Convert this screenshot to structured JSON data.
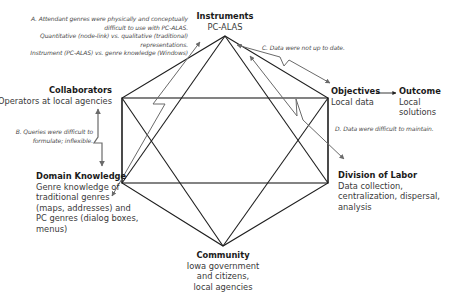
{
  "diagram": {
    "type": "activity-system-hexagon",
    "nodes": {
      "instruments": {
        "title": "Instruments",
        "body": "PC-ALAS"
      },
      "collaborators": {
        "title": "Collaborators",
        "body": "Operators at local agencies"
      },
      "objectives": {
        "title": "Objectives",
        "body": "Local data"
      },
      "outcome": {
        "title": "Outcome",
        "body": "Local\nsolutions"
      },
      "domain_knowledge": {
        "title": "Domain Knowledge",
        "body": "Genre knowledge of\ntraditional genres\n(maps, addresses) and\nPC genres (dialog  boxes, menus)"
      },
      "division_of_labor": {
        "title": "Division of Labor",
        "body": "Data collection,\ncentralization, dispersal,\nanalysis"
      },
      "community": {
        "title": "Community",
        "body": "Iowa government\nand citizens,\nlocal agencies"
      }
    },
    "contradictions": {
      "a": "A. Attendant genres were physically and conceptually\ndifficult to use with PC-ALAS.\nQuantitative (node-link) vs.  qualitative (traditional)\nrepresentations.\nInstrument (PC-ALAS) vs. genre knowledge (Windows)",
      "b": "B. Queries were  difficult to\nformulate; inflexible.",
      "c": "C. Data were not up to date.",
      "d": "D. Data were difficult to maintain."
    },
    "colors": {
      "structure_line": "#1e1e1e",
      "contradiction_arrow": "#6a6a6a",
      "text": "#3a3a3a",
      "title": "#1a1a1a"
    }
  }
}
